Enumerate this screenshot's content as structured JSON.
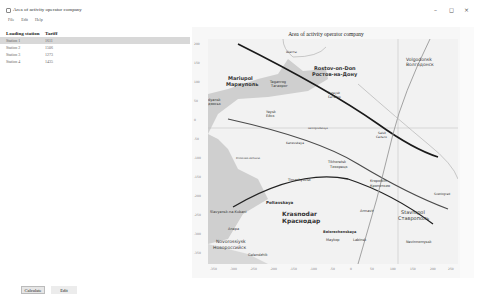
{
  "window": {
    "title": "Area of activity operator company",
    "controls": {
      "minimize": "–",
      "maximize": "◻",
      "close": "×"
    }
  },
  "menu": {
    "items": [
      "File",
      "Edit",
      "Help"
    ]
  },
  "table": {
    "headers": [
      "Loading station",
      "Tariff"
    ],
    "rows": [
      {
        "station": "Station 1",
        "tariff": "1611"
      },
      {
        "station": "Station 2",
        "tariff": "1506"
      },
      {
        "station": "Station 3",
        "tariff": "1273"
      },
      {
        "station": "Station 4",
        "tariff": "1435"
      }
    ],
    "selected_index": 0
  },
  "buttons": {
    "calculate": "Calculate",
    "edit": "Edit"
  },
  "plot": {
    "title": "Area of activity operator company",
    "y_ticks": [
      "200",
      "150",
      "100",
      "50",
      "0",
      "-50",
      "-100",
      "-150",
      "-200",
      "-250",
      "-300",
      "-350"
    ],
    "x_ticks": [
      "-350",
      "-300",
      "-250",
      "-200",
      "-150",
      "-100",
      "-50",
      "0",
      "50",
      "100",
      "150",
      "200",
      "250"
    ],
    "cities": [
      {
        "en": "Shakhty",
        "ru": "Шахты",
        "x": 118,
        "y": 8
      },
      {
        "en": "Volgodonsk",
        "ru": "Волгодонск",
        "x": 212,
        "y": 24
      },
      {
        "en": "Rostov-on-Don",
        "ru": "Ростов-на-Дону",
        "x": 112,
        "y": 35
      },
      {
        "en": "Mariupol",
        "ru": "Мариуполь",
        "x": 25,
        "y": 44
      },
      {
        "en": "Taganrog",
        "ru": "Таганрог",
        "x": 70,
        "y": 48
      },
      {
        "en": "Bataysk",
        "ru": "Батайск",
        "x": 122,
        "y": 58
      },
      {
        "en": "Berdyansk",
        "ru": "Бердянськ",
        "x": 0,
        "y": 70
      },
      {
        "en": "Yeysk",
        "ru": "Ейск",
        "x": 58,
        "y": 80
      },
      {
        "en": "Salsk",
        "ru": "Сальск",
        "x": 206,
        "y": 113
      },
      {
        "en": "Leningradskaya",
        "ru": "Ленинградская",
        "x": 100,
        "y": 118
      },
      {
        "en": "Kanevskaya",
        "ru": "Каневская",
        "x": 80,
        "y": 130
      },
      {
        "en": "Primorsko-Akhtarsk",
        "ru": "Приморско-Ахтарск",
        "x": 30,
        "y": 142
      },
      {
        "en": "Tikhoretsk",
        "ru": "Тихорецк",
        "x": 132,
        "y": 142
      },
      {
        "en": "Timashyovsk",
        "ru": "Тимашёвск",
        "x": 68,
        "y": 155
      },
      {
        "en": "Kropotkin",
        "ru": "Кропоткин",
        "x": 160,
        "y": 160
      },
      {
        "en": "Korenovsk",
        "ru": "Кореновск",
        "x": 110,
        "y": 163
      },
      {
        "en": "Svetlograd",
        "ru": "Светлоград",
        "x": 228,
        "y": 168
      },
      {
        "en": "Poltavskaya",
        "ru": "Полтавская",
        "x": 40,
        "y": 178
      },
      {
        "en": "Slavyansk-na-Kubani",
        "ru": "Славянск-на-Кубани",
        "x": 0,
        "y": 185
      },
      {
        "en": "Krasnodar",
        "ru": "Краснодар",
        "x": 70,
        "y": 190
      },
      {
        "en": "Armavir",
        "ru": "Армавир",
        "x": 150,
        "y": 190
      },
      {
        "en": "Stavropol",
        "ru": "Ставрополь",
        "x": 200,
        "y": 190
      },
      {
        "en": "Anapa",
        "ru": "Анапа",
        "x": 10,
        "y": 200
      },
      {
        "en": "Belorechenskaya",
        "ru": "Белореченская",
        "x": 118,
        "y": 205
      },
      {
        "en": "Maykop",
        "ru": "Майкоп",
        "x": 118,
        "y": 215
      },
      {
        "en": "Labinsk",
        "ru": "Лабинск",
        "x": 148,
        "y": 215
      },
      {
        "en": "Nevinnomyssk",
        "ru": "Невинномысск",
        "x": 198,
        "y": 215
      },
      {
        "en": "Novorossiysk",
        "ru": "Новороссийск",
        "x": 5,
        "y": 215
      },
      {
        "en": "Gelendzhik",
        "ru": "Геленджик",
        "x": 38,
        "y": 228
      }
    ]
  },
  "colors": {
    "line_dark": "#1a1a1a",
    "line_mid": "#4a4a4a",
    "line_gray": "#999999",
    "sea": "#cfcfcf",
    "land": "#f0f0f0"
  }
}
